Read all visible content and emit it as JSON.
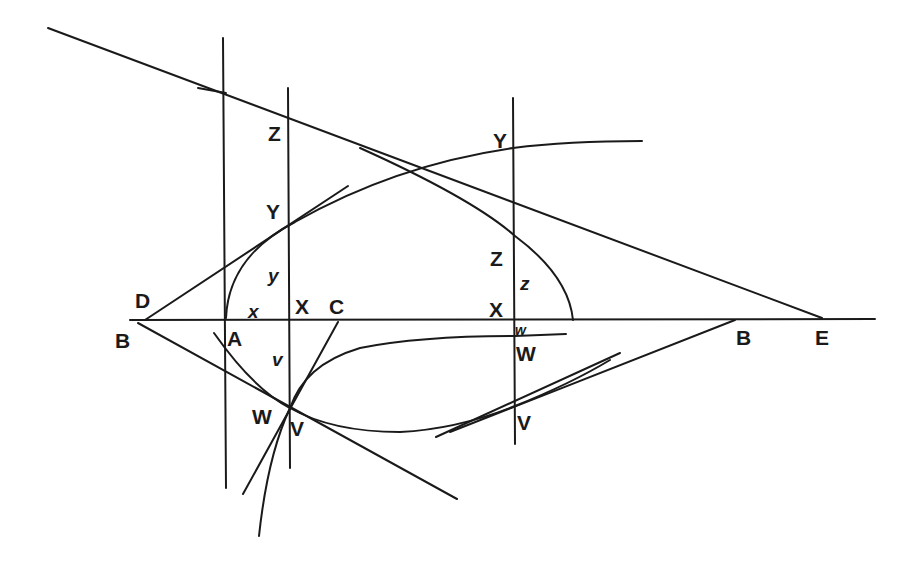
{
  "diagram": {
    "type": "geometric construction",
    "stroke_color": "#1a1a1a",
    "background": "#ffffff",
    "labels": {
      "D": "D",
      "B_left": "B",
      "A": "A",
      "x_small": "x",
      "X_left": "X",
      "C": "C",
      "y_small": "y",
      "Y_left": "Y",
      "Z_left": "Z",
      "v_small": "v",
      "W_left": "W",
      "V_left": "V",
      "Y_right": "Y",
      "Z_right": "Z",
      "z_small": "z",
      "X_right": "X",
      "w_small": "w",
      "W_right": "W",
      "V_right": "V",
      "B_right": "B",
      "E": "E"
    }
  }
}
